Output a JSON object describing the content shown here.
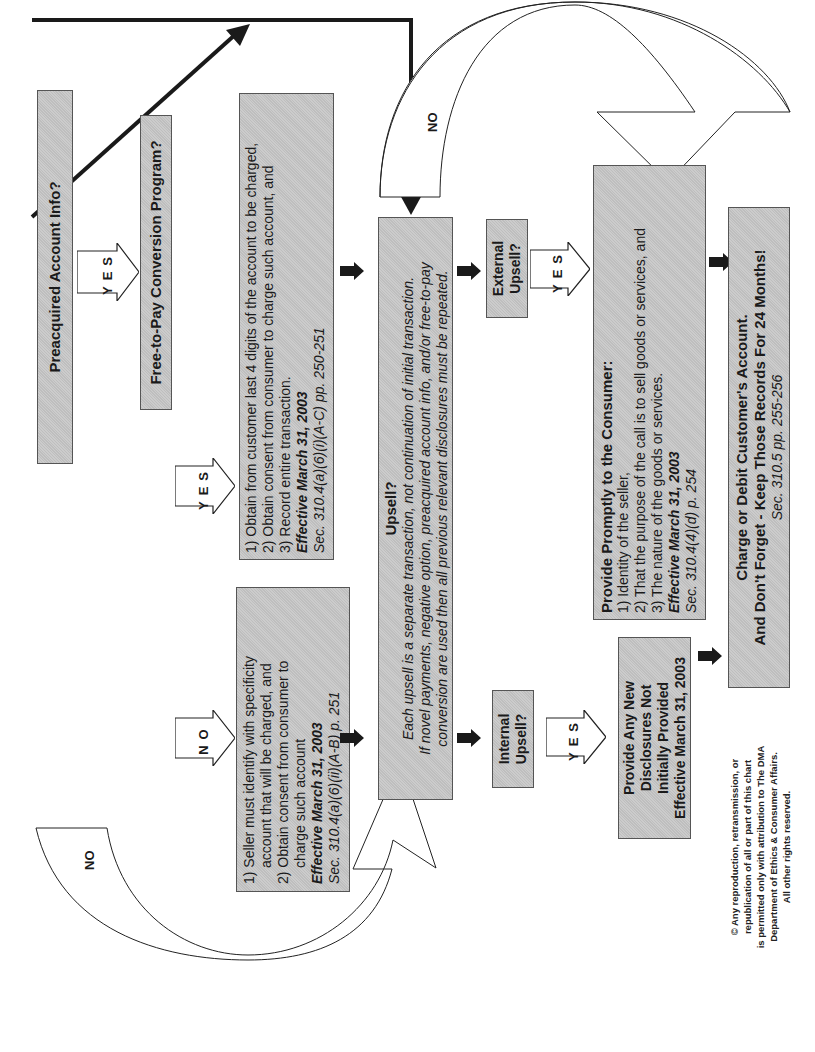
{
  "orientation": "rotated-90-ccw",
  "colors": {
    "box_fill": "#c6c6c6",
    "box_border": "#555555",
    "arrow_fill": "#1a1a1a",
    "outline_arrow_fill": "#ffffff"
  },
  "nodes": {
    "preacquired": {
      "label": "Preacquired Account Info?"
    },
    "free_to_pay": {
      "label": "Free-to-Pay Conversion Program?"
    },
    "ftp_yes": {
      "lines": [
        "1) Obtain from customer last 4 digits of the account to be charged,",
        "2) Obtain consent from consumer to charge such account, and",
        "3) Record entire transaction."
      ],
      "effective": "Effective March 31, 2003",
      "citation": "Sec. 310.4(a)(6)(i)(A-C) pp. 250-251"
    },
    "ftp_no": {
      "lines": [
        "1) Seller must identify with specificity",
        "account that will be charged, and",
        "2) Obtain consent from consumer to",
        "charge such account"
      ],
      "effective": "Effective March 31, 2003",
      "citation": "Sec. 310.4(a)(6)(ii)(A-B) p. 251"
    },
    "upsell": {
      "title": "Upsell?",
      "lines": [
        "Each upsell is a separate transaction, not continuation of initial transaction.",
        "If novel payments, negative option, preacquired account info, and/or free-to-pay",
        "conversion are used then all previous relevant disclosures must be repeated."
      ]
    },
    "internal_upsell": {
      "label_line1": "Internal",
      "label_line2": "Upsell?"
    },
    "external_upsell": {
      "label_line1": "External",
      "label_line2": "Upsell?"
    },
    "internal_yes": {
      "lines": [
        "Provide Any New",
        "Disclosures Not",
        "Initially Provided",
        "Effective March 31, 2003"
      ]
    },
    "external_yes": {
      "title": "Provide Promptly to the Consumer:",
      "lines": [
        "1) Identity of the seller,",
        "2) That the purpose of the call is to sell goods or services, and",
        "3) The nature of the goods or services."
      ],
      "effective": "Effective March 31, 2003",
      "citation": "Sec. 310.4(4)(d) p. 254"
    },
    "charge": {
      "line1": "Charge or Debit Customer's Account.",
      "line2": "And Don't Forget - Keep Those Records For 24 Months!",
      "citation": "Sec. 310.5  pp. 255-256"
    }
  },
  "connectors": {
    "yes_letters": [
      "Y",
      "E",
      "S"
    ],
    "no_letters": [
      "N",
      "O"
    ],
    "no_curve_label": "NO"
  },
  "copyright": {
    "lines": [
      "© Any reproduction, retransmission, or",
      "republication of all or part of this chart",
      "is permitted only with attribution to The DMA",
      "Department of Ethics & Consumer Affairs.",
      "All other rights reserved."
    ]
  }
}
